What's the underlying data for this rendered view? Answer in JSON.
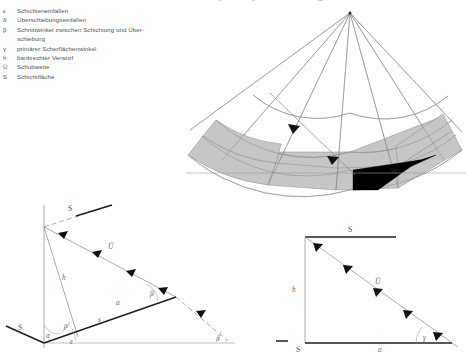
{
  "figure": {
    "language": "de",
    "legend": {
      "items": [
        {
          "symbol": "ε",
          "text": "Schichteneinfallen"
        },
        {
          "symbol": "δ",
          "text": "Überschiebungseinfallen"
        },
        {
          "symbol": "β",
          "text": "Schnittwinkel zwischen Schichtung und Über-",
          "cont": "schiebung"
        },
        {
          "symbol": "γ",
          "text": "primärer Scherflächenwinkel"
        },
        {
          "symbol": "h",
          "text": "bankrechter Verwurf"
        },
        {
          "symbol": "Ü",
          "text": "Schubweite"
        },
        {
          "symbol": "S",
          "text": "Schichtfläche"
        }
      ]
    },
    "top_crop": {
      "marks": [
        "δ",
        "δ",
        "m"
      ]
    },
    "fan_diagram": {
      "name": "radial-fan-diagram",
      "bands": 2,
      "band_color": "#c6c6c6",
      "wedge_color": "#000000",
      "ray_count": 7,
      "arc_count": 4
    },
    "triangle_left": {
      "name": "oblique-vector-triangle",
      "labels": {
        "bedding_top": "S",
        "bedding_bottom": "S",
        "throw": "h",
        "slip": "Ü",
        "offset_a": "a",
        "offset_s": "s",
        "angle_alpha": "α",
        "angle_rho": "ρ",
        "angle_epsilon": "ε",
        "angle_beta": "β",
        "angle_delta": "δ"
      }
    },
    "triangle_right": {
      "name": "right-vector-triangle",
      "labels": {
        "top_S": "S",
        "bottom_S": "S",
        "height_h": "h",
        "base_a": "a",
        "hyp_U": "Ü",
        "angle_gamma": "γ"
      }
    }
  }
}
